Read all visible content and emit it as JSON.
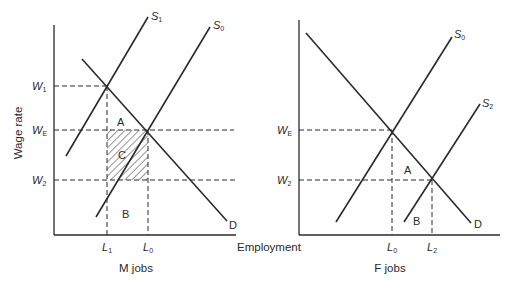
{
  "colors": {
    "ink": "#2a2a2a",
    "background": "#ffffff"
  },
  "left_panel": {
    "title": "M jobs",
    "y_axis_label": "Wage rate",
    "y_ticks": [
      {
        "main": "W",
        "sub": "1"
      },
      {
        "main": "W",
        "sub": "E"
      },
      {
        "main": "W",
        "sub": "2"
      }
    ],
    "x_ticks": [
      {
        "main": "L",
        "sub": "1"
      },
      {
        "main": "L",
        "sub": "0"
      }
    ],
    "curves": {
      "s1": {
        "main": "S",
        "sub": "1"
      },
      "s0": {
        "main": "S",
        "sub": "0"
      },
      "d": "D"
    },
    "areas": {
      "a": "A",
      "b": "B",
      "c": "C"
    }
  },
  "shared_x_axis_label": "Employment",
  "right_panel": {
    "title": "F jobs",
    "y_ticks": [
      {
        "main": "W",
        "sub": "E"
      },
      {
        "main": "W",
        "sub": "2"
      }
    ],
    "x_ticks": [
      {
        "main": "L",
        "sub": "0"
      },
      {
        "main": "L",
        "sub": "2"
      }
    ],
    "curves": {
      "s0": {
        "main": "S",
        "sub": "0"
      },
      "s2": {
        "main": "S",
        "sub": "2"
      },
      "d": "D"
    },
    "areas": {
      "a": "A",
      "b": "B"
    }
  }
}
